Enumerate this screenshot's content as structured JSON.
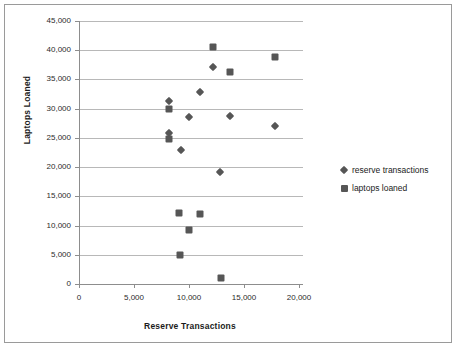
{
  "chart_data": {
    "type": "scatter",
    "title": "",
    "xlabel": "Reserve Transactions",
    "ylabel": "Laptops Loaned",
    "xlim": [
      0,
      20000
    ],
    "ylim": [
      0,
      45000
    ],
    "xticks": [
      "0",
      "5,000",
      "10,000",
      "15,000",
      "20,000"
    ],
    "xtick_values": [
      0,
      5000,
      10000,
      15000,
      20000
    ],
    "yticks": [
      "0",
      "5,000",
      "10,000",
      "15,000",
      "20,000",
      "25,000",
      "30,000",
      "35,000",
      "40,000",
      "45,000"
    ],
    "ytick_values": [
      0,
      5000,
      10000,
      15000,
      20000,
      25000,
      30000,
      35000,
      40000,
      45000
    ],
    "grid": true,
    "legend_position": "right",
    "marker_color": "#565656",
    "series": [
      {
        "name": "reserve transactions",
        "marker": "diamond",
        "points": [
          {
            "x": 8200,
            "y": 31400
          },
          {
            "x": 8200,
            "y": 25900
          },
          {
            "x": 9300,
            "y": 22900
          },
          {
            "x": 10000,
            "y": 28500
          },
          {
            "x": 11000,
            "y": 32800
          },
          {
            "x": 12200,
            "y": 37100
          },
          {
            "x": 12800,
            "y": 19200
          },
          {
            "x": 13700,
            "y": 28700
          },
          {
            "x": 17800,
            "y": 27100
          }
        ]
      },
      {
        "name": "laptops loaned",
        "marker": "square",
        "points": [
          {
            "x": 8200,
            "y": 30000
          },
          {
            "x": 8200,
            "y": 24900
          },
          {
            "x": 9100,
            "y": 12200
          },
          {
            "x": 9200,
            "y": 4900
          },
          {
            "x": 10000,
            "y": 9200
          },
          {
            "x": 11000,
            "y": 12000
          },
          {
            "x": 12200,
            "y": 40500
          },
          {
            "x": 12900,
            "y": 1100
          },
          {
            "x": 13700,
            "y": 36200
          },
          {
            "x": 17800,
            "y": 38800
          }
        ]
      }
    ],
    "legend": [
      {
        "label": "reserve transactions",
        "marker": "diamond"
      },
      {
        "label": "laptops loaned",
        "marker": "square"
      }
    ]
  }
}
